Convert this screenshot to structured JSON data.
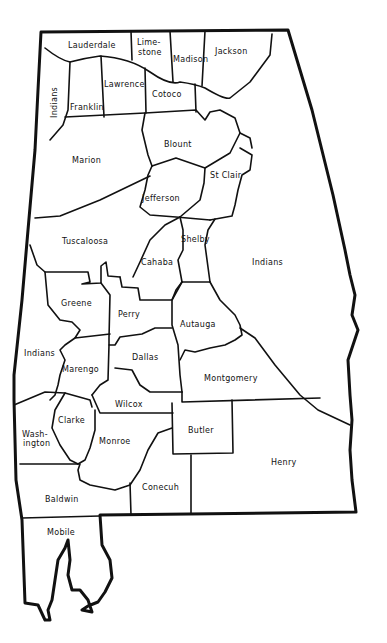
{
  "map": {
    "subject": "Alabama counties",
    "counties": [
      {
        "name": "Lauderdale",
        "x": 92,
        "y": 48
      },
      {
        "name": "Lime-",
        "x": 150,
        "y": 45
      },
      {
        "name": "stone",
        "x": 150,
        "y": 55
      },
      {
        "name": "Madison",
        "x": 190,
        "y": 62
      },
      {
        "name": "Jackson",
        "x": 237,
        "y": 54
      },
      {
        "name": "Indians",
        "x": 57,
        "y": 104,
        "rotate": -90
      },
      {
        "name": "Franklin",
        "x": 85,
        "y": 108
      },
      {
        "name": "Lawrence",
        "x": 124,
        "y": 86
      },
      {
        "name": "Cotoco",
        "x": 165,
        "y": 96
      },
      {
        "name": "Marion",
        "x": 86,
        "y": 162
      },
      {
        "name": "Blount",
        "x": 178,
        "y": 146
      },
      {
        "name": "St Clair",
        "x": 227,
        "y": 177
      },
      {
        "name": "Jefferson",
        "x": 165,
        "y": 200
      },
      {
        "name": "Tuscaloosa",
        "x": 86,
        "y": 243
      },
      {
        "name": "Shelby",
        "x": 195,
        "y": 241
      },
      {
        "name": "Cahaba",
        "x": 156,
        "y": 264
      },
      {
        "name": "Indians",
        "x": 267,
        "y": 264
      },
      {
        "name": "Greene",
        "x": 75,
        "y": 305
      },
      {
        "name": "Perry",
        "x": 129,
        "y": 316
      },
      {
        "name": "Autauga",
        "x": 196,
        "y": 326
      },
      {
        "name": "Indians",
        "x": 39,
        "y": 355
      },
      {
        "name": "Marengo",
        "x": 76,
        "y": 371
      },
      {
        "name": "Dallas",
        "x": 145,
        "y": 359
      },
      {
        "name": "Montgomery",
        "x": 230,
        "y": 380
      },
      {
        "name": "Wilcox",
        "x": 127,
        "y": 406
      },
      {
        "name": "Clarke",
        "x": 70,
        "y": 422
      },
      {
        "name": "Wash-",
        "x": 33,
        "y": 436
      },
      {
        "name": "ington",
        "x": 34,
        "y": 445
      },
      {
        "name": "Butler",
        "x": 202,
        "y": 432
      },
      {
        "name": "Monroe",
        "x": 114,
        "y": 443
      },
      {
        "name": "Henry",
        "x": 284,
        "y": 464
      },
      {
        "name": "Conecuh",
        "x": 155,
        "y": 489
      },
      {
        "name": "Baldwin",
        "x": 60,
        "y": 501
      },
      {
        "name": "Mobile",
        "x": 61,
        "y": 534
      }
    ]
  }
}
